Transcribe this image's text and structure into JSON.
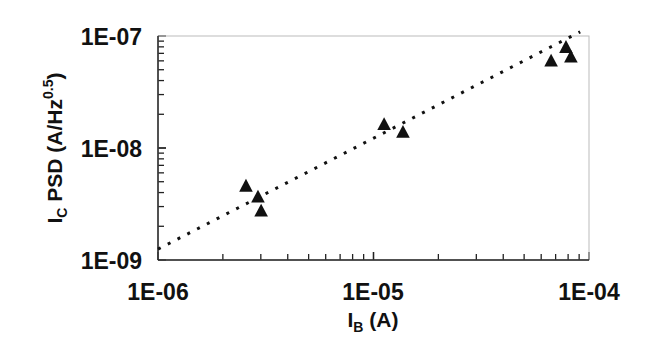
{
  "chart_data": {
    "type": "scatter",
    "title": "",
    "xlabel": "I_B (A)",
    "xlabel_main": "I",
    "xlabel_sub": "B",
    "xlabel_rest": " (A)",
    "ylabel": "I_C PSD (A/Hz^0.5)",
    "ylabel_main": "I",
    "ylabel_sub": "C",
    "ylabel_mid": " PSD (A/Hz",
    "ylabel_sup": "0.5",
    "ylabel_end": ")",
    "xscale": "log",
    "yscale": "log",
    "xlim": [
      1e-06,
      0.0001
    ],
    "ylim": [
      1e-09,
      1e-07
    ],
    "x_ticks": [
      "1E-06",
      "1E-05",
      "1E-04"
    ],
    "y_ticks": [
      "1E-07",
      "1E-08",
      "1E-09"
    ],
    "grid": false,
    "legend": null,
    "series": [
      {
        "name": "measured",
        "marker": "triangle",
        "color": "#111111",
        "points": [
          {
            "x": 2.56e-06,
            "y": 4.5e-09
          },
          {
            "x": 2.91e-06,
            "y": 3.6e-09
          },
          {
            "x": 3.01e-06,
            "y": 2.7e-09
          },
          {
            "x": 1.12e-05,
            "y": 1.6e-08
          },
          {
            "x": 1.37e-05,
            "y": 1.36e-08
          },
          {
            "x": 6.67e-05,
            "y": 5.9e-08
          },
          {
            "x": 7.82e-05,
            "y": 7.8e-08
          },
          {
            "x": 8.24e-05,
            "y": 6.4e-08
          }
        ]
      },
      {
        "name": "fit",
        "style": "dotted",
        "color": "#111111",
        "points": [
          {
            "x": 1e-06,
            "y": 1.25e-09
          },
          {
            "x": 9.1e-05,
            "y": 1.09e-07
          }
        ]
      }
    ]
  }
}
